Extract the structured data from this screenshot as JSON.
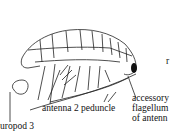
{
  "diagram": {
    "labels": {
      "uropod": "uropod 3",
      "antenna2": "antenna 2 peduncle",
      "accessory_line1": "accessory",
      "accessory_line2": "flagellum",
      "accessory_line3": "of antenn",
      "edge_letter": "r"
    },
    "colors": {
      "ink": "#111111",
      "background": "#ffffff"
    }
  }
}
